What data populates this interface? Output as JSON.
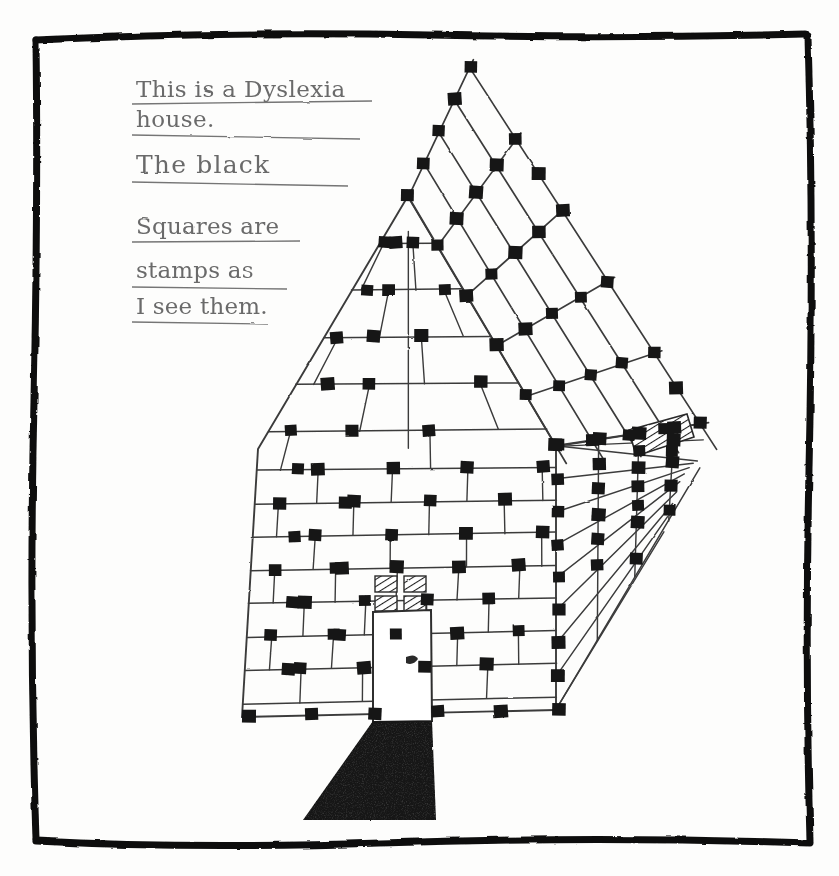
{
  "artwork": {
    "title": "Dyslexia house pencil drawing",
    "medium": "pencil and ink on white paper",
    "subject": "house in perspective covered with black square stamps",
    "paper_color": "#fdfdfc",
    "ink_color": "#1a1a1a",
    "pencil_color": "#6b6b6b",
    "stamp_color": "#141414"
  },
  "frame": {
    "name": "hand-drawn-border",
    "color": "#111111",
    "stroke_width": 7,
    "left": 33,
    "top": 33,
    "right": 810,
    "bottom": 843
  },
  "handwriting": {
    "color": "#6b6b6b",
    "underline_color": "#757575",
    "lines": [
      {
        "text": "This is a Dyslexia",
        "x": 136,
        "y": 97,
        "size": 23,
        "underline": {
          "x1": 132,
          "y1": 104,
          "x2": 372,
          "y2": 101
        }
      },
      {
        "text": "house.",
        "x": 136,
        "y": 125,
        "size": 23,
        "underline": {
          "x1": 132,
          "y1": 133,
          "x2": 360,
          "y2": 137
        }
      },
      {
        "text": "The  black",
        "x": 136,
        "y": 171,
        "size": 25,
        "underline": {
          "x1": 132,
          "y1": 181,
          "x2": 348,
          "y2": 184
        }
      },
      {
        "text": "Squares are",
        "x": 136,
        "y": 233,
        "size": 23,
        "underline": {
          "x1": 132,
          "y1": 241,
          "x2": 300,
          "y2": 240
        }
      },
      {
        "text": "stamps as",
        "x": 136,
        "y": 277,
        "size": 23,
        "underline": {
          "x1": 132,
          "y1": 286,
          "x2": 287,
          "y2": 288
        }
      },
      {
        "text": "I see them.",
        "x": 136,
        "y": 313,
        "size": 23,
        "underline": {
          "x1": 132,
          "y1": 321,
          "x2": 268,
          "y2": 323
        }
      }
    ]
  },
  "house": {
    "name": "dyslexia-house",
    "line_color": "#3b3b3b",
    "line_width": 1.6,
    "facade": {
      "name": "front-wall",
      "apex": {
        "x": 408,
        "y": 196
      },
      "left_eave": {
        "x": 258,
        "y": 449
      },
      "right_eave": {
        "x": 556,
        "y": 446
      },
      "left_base": {
        "x": 242,
        "y": 717
      },
      "right_base": {
        "x": 556,
        "y": 710
      },
      "courses": 13,
      "stamp_count": 58
    },
    "roof": {
      "name": "roof-plane",
      "ridge_top": {
        "x": 470,
        "y": 68
      },
      "right_far": {
        "x": 700,
        "y": 424
      },
      "eave_left": {
        "x": 408,
        "y": 196
      },
      "rows": 4,
      "cols": 5,
      "stamp_count": 34
    },
    "side_wall": {
      "name": "right-side-wall",
      "top": {
        "x": 556,
        "y": 446
      },
      "bottom": {
        "x": 556,
        "y": 710
      },
      "vanish": {
        "x": 700,
        "y": 470
      },
      "courses": 8,
      "stamp_count": 22
    },
    "door": {
      "name": "front-door",
      "x": 373,
      "y": 598,
      "width": 55,
      "height": 122,
      "knob": {
        "x": 411,
        "y": 660
      }
    },
    "window_front": {
      "name": "front-window-hatched",
      "x": 375,
      "y": 576,
      "width": 52,
      "height": 36,
      "panes": 4,
      "fill": "diagonal-hatch"
    },
    "window_side": {
      "name": "side-window-hatched",
      "points": "630,432 686,417 692,437 637,455",
      "fill": "diagonal-hatch"
    },
    "walkway": {
      "name": "front-walkway-shadow",
      "points": "373,720 430,720 434,820 303,820",
      "fill": "#141414"
    }
  },
  "stamps": {
    "name": "black-square-stamps",
    "description": "small solid black squares placed at grid line intersections",
    "size": 13,
    "color": "#141414",
    "total_visible": 114
  }
}
